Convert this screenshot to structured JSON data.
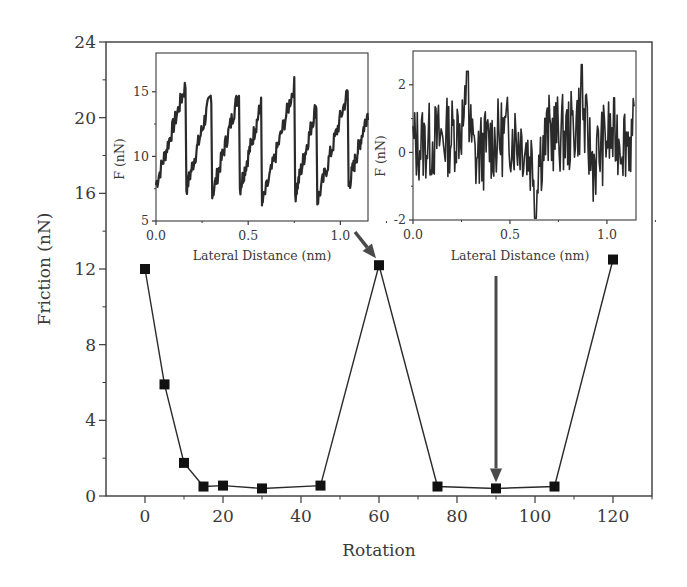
{
  "chart_data": [
    {
      "id": "main",
      "type": "line",
      "title": "",
      "xlabel": "Rotation",
      "ylabel": "Friction (nN)",
      "xlim": [
        -10,
        130
      ],
      "ylim": [
        0,
        24
      ],
      "xticks": [
        0,
        20,
        40,
        60,
        80,
        100,
        120
      ],
      "yticks": [
        0,
        4,
        8,
        12,
        16,
        20,
        24
      ],
      "grid": false,
      "marker": "square",
      "series": [
        {
          "name": "Friction vs rotation",
          "x": [
            0,
            5,
            10,
            15,
            20,
            30,
            45,
            60,
            75,
            90,
            105,
            120
          ],
          "y": [
            12.0,
            5.9,
            1.75,
            0.5,
            0.55,
            0.4,
            0.55,
            12.2,
            0.5,
            0.4,
            0.5,
            12.5
          ]
        }
      ],
      "annotations": [
        {
          "type": "arrow",
          "from": "inset-1",
          "to_x": 60,
          "to_y": 12.2,
          "note": "points from left inset to 60° peak"
        },
        {
          "type": "arrow",
          "from": "inset-2",
          "to_x": 90,
          "to_y": 0.4,
          "note": "points from right inset to 90° minimum"
        }
      ]
    },
    {
      "id": "inset-1",
      "type": "line",
      "title": "",
      "xlabel": "Lateral Distance (nm)",
      "ylabel": "F (nN)",
      "xlim": [
        0.0,
        1.15
      ],
      "ylim": [
        5,
        18
      ],
      "xticks": [
        0.0,
        0.5,
        1.0
      ],
      "yticks": [
        5,
        10,
        15
      ],
      "description": "stick-slip sawtooth, ramps from ~8 to ~15 nN then drops",
      "series": [
        {
          "name": "lateral force (commensurate)",
          "x": [
            0.0,
            0.16,
            0.165,
            0.3,
            0.305,
            0.45,
            0.455,
            0.57,
            0.575,
            0.75,
            0.755,
            0.87,
            0.875,
            1.04,
            1.045,
            1.15
          ],
          "y": [
            7.8,
            15.5,
            7.5,
            14.8,
            7.0,
            15.0,
            7.5,
            14.0,
            6.2,
            15.5,
            7.0,
            14.0,
            6.5,
            15.0,
            7.7,
            13.5
          ]
        }
      ]
    },
    {
      "id": "inset-2",
      "type": "line",
      "title": "",
      "xlabel": "Lateral Distance (nm)",
      "ylabel": "F (nN)",
      "xlim": [
        0.0,
        1.15
      ],
      "ylim": [
        -2,
        3
      ],
      "xticks": [
        0.0,
        0.5,
        1.0
      ],
      "yticks": [
        -2,
        0,
        2
      ],
      "description": "noisy fluctuation around ~0.3 nN, range about -2 to 2.5",
      "series": [
        {
          "name": "lateral force (incommensurate)",
          "x": [
            0.0,
            0.1,
            0.2,
            0.28,
            0.32,
            0.4,
            0.5,
            0.56,
            0.63,
            0.7,
            0.8,
            0.87,
            0.93,
            1.0,
            1.15
          ],
          "y": [
            0.0,
            0.3,
            0.8,
            2.4,
            -1.2,
            0.2,
            1.0,
            0.5,
            -1.9,
            1.0,
            0.8,
            2.6,
            -1.6,
            0.7,
            0.5
          ]
        }
      ]
    }
  ],
  "labels": {
    "main_xlabel": "Rotation",
    "main_ylabel": "Friction (nN)",
    "inset1_xlabel": "Lateral Distance (nm)",
    "inset1_ylabel": "F (nN)",
    "inset2_xlabel": "Lateral Distance (nm)",
    "inset2_ylabel": "F (nN)"
  },
  "colors": {
    "axis": "#3a3a3a",
    "line": "#2a2a2a",
    "marker": "#111111",
    "arrow": "#4a4a4a"
  }
}
